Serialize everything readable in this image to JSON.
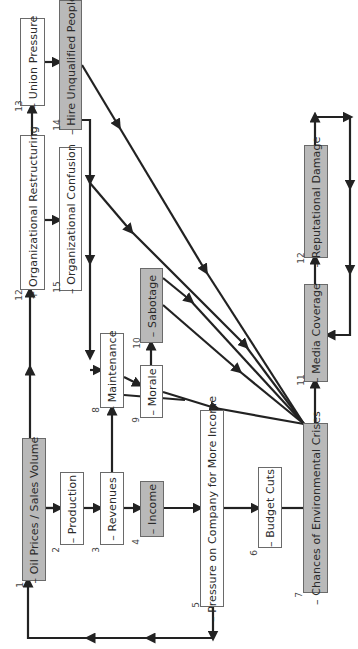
{
  "diagram": {
    "orientation": "rotated-90-ccw",
    "colors": {
      "gray_node": "#b9b9b9",
      "white_node": "#ffffff",
      "edge": "#222222",
      "border": "#6a6a6a"
    },
    "nodes": [
      {
        "id": 1,
        "num": "1",
        "label": "– Oil Prices / Sales Volume",
        "fill": "gray"
      },
      {
        "id": 2,
        "num": "2",
        "label": "– Production",
        "fill": "white"
      },
      {
        "id": 3,
        "num": "3",
        "label": "– Revenues",
        "fill": "white"
      },
      {
        "id": 4,
        "num": "4",
        "label": "– Income",
        "fill": "gray"
      },
      {
        "id": 5,
        "num": "5",
        "label": "– Pressure on Company for More Income",
        "fill": "white"
      },
      {
        "id": 6,
        "num": "6",
        "label": "– Budget Cuts",
        "fill": "white"
      },
      {
        "id": 7,
        "num": "7",
        "label": "– Chances of Environmental Crises",
        "fill": "gray"
      },
      {
        "id": 8,
        "num": "8",
        "label": "– Maintenance",
        "fill": "white"
      },
      {
        "id": 9,
        "num": "9",
        "label": "– Morale",
        "fill": "white"
      },
      {
        "id": 10,
        "num": "10",
        "label": "– Sabotage",
        "fill": "gray"
      },
      {
        "id": 11,
        "num": "11",
        "label": "– Media Coverage",
        "fill": "gray"
      },
      {
        "id": 12,
        "num": "12",
        "label": "– Reputational Damage",
        "fill": "gray"
      },
      {
        "id": 13,
        "num": "12",
        "label": "+ Organizational Restructuring",
        "fill": "white"
      },
      {
        "id": 14,
        "num": "13",
        "label": "– Union Pressure",
        "fill": "white"
      },
      {
        "id": 15,
        "num": "14",
        "label": "– Hire Unqualified People",
        "fill": "gray"
      },
      {
        "id": 16,
        "num": "15",
        "label": "– Organizational Confusion",
        "fill": "white"
      }
    ],
    "edges": [
      [
        "Oil Prices / Sales Volume",
        "Production"
      ],
      [
        "Production",
        "Revenues"
      ],
      [
        "Revenues",
        "Income"
      ],
      [
        "Revenues",
        "Maintenance"
      ],
      [
        "Income",
        "Pressure on Company for More Income"
      ],
      [
        "Pressure on Company for More Income",
        "Budget Cuts"
      ],
      [
        "Pressure on Company for More Income",
        "Oil Prices / Sales Volume"
      ],
      [
        "Budget Cuts",
        "Chances of Environmental Crises"
      ],
      [
        "Oil Prices / Sales Volume",
        "Organizational Restructuring"
      ],
      [
        "Organizational Restructuring",
        "Union Pressure"
      ],
      [
        "Organizational Restructuring",
        "Organizational Confusion"
      ],
      [
        "Union Pressure",
        "Hire Unqualified People"
      ],
      [
        "Hire Unqualified People",
        "Maintenance"
      ],
      [
        "Hire Unqualified People",
        "Chances of Environmental Crises"
      ],
      [
        "Organizational Confusion",
        "Chances of Environmental Crises"
      ],
      [
        "Maintenance",
        "Morale"
      ],
      [
        "Maintenance",
        "Chances of Environmental Crises"
      ],
      [
        "Morale",
        "Sabotage"
      ],
      [
        "Morale",
        "Chances of Environmental Crises"
      ],
      [
        "Sabotage",
        "Chances of Environmental Crises"
      ],
      [
        "Chances of Environmental Crises",
        "Media Coverage"
      ],
      [
        "Media Coverage",
        "Reputational Damage"
      ],
      [
        "Reputational Damage",
        "Media Coverage"
      ]
    ]
  }
}
